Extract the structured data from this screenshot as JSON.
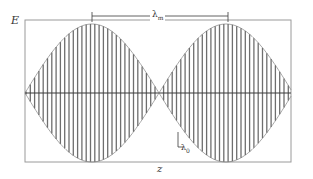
{
  "figure": {
    "y_axis_label": "E",
    "x_axis_label": "z",
    "modulation_wavelength_symbol": "λ",
    "modulation_wavelength_subscript": "m",
    "carrier_wavelength_symbol": "λ",
    "carrier_wavelength_subscript": "0",
    "colors": {
      "background": "#ffffff",
      "carrier_lines": "#6e6e6e",
      "frame": "#9a9a9a",
      "axis": "#3a3a3a",
      "text": "#333333"
    },
    "geometry": {
      "frame": {
        "x0": 25,
        "y0": 20,
        "x1": 291,
        "y1": 162
      },
      "axis_y": 93,
      "envelope_period_px": 134,
      "envelope_first_peak_x": 92,
      "carrier_period_px": 4.3,
      "lambda_m_bracket": {
        "x0": 92,
        "x1": 228,
        "y": 16
      }
    }
  }
}
